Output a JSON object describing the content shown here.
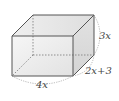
{
  "diagram": {
    "type": "rectangular-prism",
    "labels": {
      "height": "3x",
      "depth": "2x+3",
      "width": "4x"
    },
    "colors": {
      "edge": "#555555",
      "hidden_edge": "#777777",
      "face_front": "#ebebeb",
      "face_top": "#e4e4e4",
      "face_side": "#dcdcdc",
      "dim_arc": "#999999"
    }
  }
}
